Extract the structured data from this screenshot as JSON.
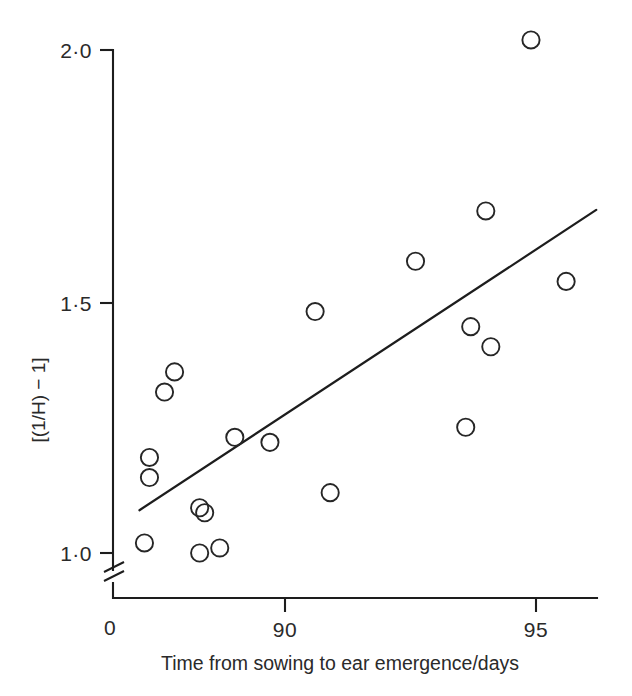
{
  "chart_data": {
    "type": "scatter",
    "title": "",
    "xlabel": "Time from sowing to ear emergence/days",
    "ylabel": "[(1/H) − 1]",
    "xlim": [
      86.8,
      96.2
    ],
    "ylim": [
      0.96,
      2.06
    ],
    "grid": false,
    "legend": "none",
    "x_ticks": [
      {
        "value": 90,
        "label": "90"
      },
      {
        "value": 95,
        "label": "95"
      }
    ],
    "y_ticks": [
      {
        "value": 1.0,
        "label": "1·0"
      },
      {
        "value": 1.5,
        "label": "1·5"
      },
      {
        "value": 2.0,
        "label": "2·0"
      }
    ],
    "origin_label": "0",
    "y_axis_break": true,
    "marker_style": "open-circle",
    "points": [
      {
        "x": 87.8,
        "y": 1.36
      },
      {
        "x": 87.6,
        "y": 1.32
      },
      {
        "x": 87.3,
        "y": 1.19
      },
      {
        "x": 87.3,
        "y": 1.15
      },
      {
        "x": 87.2,
        "y": 1.02
      },
      {
        "x": 88.3,
        "y": 1.09
      },
      {
        "x": 88.4,
        "y": 1.08
      },
      {
        "x": 88.3,
        "y": 1.0
      },
      {
        "x": 88.7,
        "y": 1.01
      },
      {
        "x": 89.0,
        "y": 1.23
      },
      {
        "x": 89.7,
        "y": 1.22
      },
      {
        "x": 90.6,
        "y": 1.48
      },
      {
        "x": 90.9,
        "y": 1.12
      },
      {
        "x": 92.6,
        "y": 1.58
      },
      {
        "x": 93.6,
        "y": 1.25
      },
      {
        "x": 93.7,
        "y": 1.45
      },
      {
        "x": 94.0,
        "y": 1.68
      },
      {
        "x": 94.1,
        "y": 1.41
      },
      {
        "x": 94.9,
        "y": 2.02
      },
      {
        "x": 95.6,
        "y": 1.54
      }
    ],
    "fit_line": {
      "label": "regression line",
      "x_start": 87.1,
      "y_start": 1.085,
      "x_end": 96.2,
      "y_end": 1.682
    }
  }
}
